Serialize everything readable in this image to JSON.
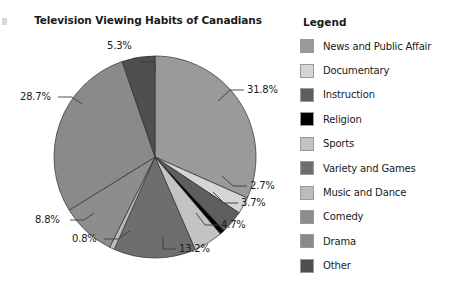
{
  "chart_data": {
    "type": "pie",
    "title": "Television Viewing Habits of Canadians",
    "legend_title": "Legend",
    "legend_position": "right",
    "start_angle_deg": 0,
    "direction": "clockwise",
    "unit": "%",
    "categories": [
      "News and Public Affair",
      "Documentary",
      "Instruction",
      "Religion",
      "Sports",
      "Variety and Games",
      "Music and Dance",
      "Comedy",
      "Drama",
      "Other"
    ],
    "values": [
      31.8,
      2.7,
      3.7,
      0.8,
      4.7,
      13.2,
      0.8,
      8.8,
      28.7,
      5.3
    ],
    "colors": [
      "#9a9a9a",
      "#d5d5d5",
      "#5e5e5e",
      "#000000",
      "#c3c3c3",
      "#6e6e6e",
      "#bcbcbc",
      "#8d8d8d",
      "#8a8a8a",
      "#4f4f4f"
    ],
    "slices": [
      {
        "label": "31.8%",
        "value": 31.8,
        "color": "#9a9a9a",
        "category": "News and Public Affair"
      },
      {
        "label": "2.7%",
        "value": 2.7,
        "color": "#d5d5d5",
        "category": "Documentary"
      },
      {
        "label": "3.7%",
        "value": 3.7,
        "color": "#5e5e5e",
        "category": "Instruction"
      },
      {
        "label": "4.7%",
        "value": 4.7,
        "color": "#c3c3c3",
        "category": "Sports"
      },
      {
        "label": "13.2%",
        "value": 13.2,
        "color": "#6e6e6e",
        "category": "Variety and Games"
      },
      {
        "label": "0.8%",
        "value": 0.8,
        "color": "#bcbcbc",
        "category": "Music and Dance"
      },
      {
        "label": "8.8%",
        "value": 8.8,
        "color": "#8d8d8d",
        "category": "Comedy"
      },
      {
        "label": "28.7%",
        "value": 28.7,
        "color": "#8a8a8a",
        "category": "Drama"
      },
      {
        "label": "5.3%",
        "value": 5.3,
        "color": "#4f4f4f",
        "category": "Other"
      }
    ],
    "data_labels": [
      "31.8%",
      "2.7%",
      "3.7%",
      "4.7%",
      "13.2%",
      "0.8%",
      "8.8%",
      "28.7%",
      "5.3%"
    ]
  },
  "legend": {
    "title": "Legend",
    "items": [
      {
        "label": "News and Public Affair",
        "color": "#9a9a9a"
      },
      {
        "label": "Documentary",
        "color": "#d5d5d5"
      },
      {
        "label": "Instruction",
        "color": "#5e5e5e"
      },
      {
        "label": "Religion",
        "color": "#000000"
      },
      {
        "label": "Sports",
        "color": "#c3c3c3"
      },
      {
        "label": "Variety and Games",
        "color": "#6e6e6e"
      },
      {
        "label": "Music and Dance",
        "color": "#bcbcbc"
      },
      {
        "label": "Comedy",
        "color": "#8d8d8d"
      },
      {
        "label": "Drama",
        "color": "#8a8a8a"
      },
      {
        "label": "Other",
        "color": "#4f4f4f"
      }
    ]
  }
}
